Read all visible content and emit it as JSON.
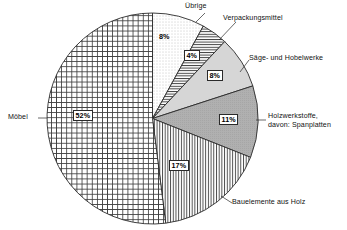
{
  "chart_data": {
    "type": "pie",
    "title": "",
    "subtitle": "",
    "xlabel": "",
    "ylabel": "",
    "legend_position": "callout-labels",
    "grid": false,
    "unit": "%",
    "total": 100,
    "categories": [
      "Übrige",
      "Verpackungsmittel",
      "Säge- und Hobelwerke",
      "Holzwerkstoffe, davon: Spanplatten",
      "Bauelemente aus Holz",
      "Möbel"
    ],
    "values": [
      8,
      4,
      8,
      11,
      17,
      52
    ],
    "slices": [
      {
        "name": "uebrige",
        "label": "Übrige",
        "value": 8,
        "value_text": "8%",
        "fill": "dotted",
        "start_angle": 0,
        "end_angle": 28.8
      },
      {
        "name": "verpackungsmittel",
        "label": "Verpackungsmittel",
        "value": 4,
        "value_text": "4%",
        "fill": "horizontal-lines",
        "start_angle": 28.8,
        "end_angle": 43.2
      },
      {
        "name": "saege-und-hobelwerke",
        "label": "Säge- und Hobelwerke",
        "value": 8,
        "value_text": "8%",
        "fill": "light-gray",
        "start_angle": 43.2,
        "end_angle": 72.0
      },
      {
        "name": "holzwerkstoffe",
        "label": "Holzwerkstoffe, davon: Spanplatten",
        "label_line1": "Holzwerkstoffe,",
        "label_line2": "davon: Spanplatten",
        "value": 11,
        "value_text": "11%",
        "fill": "dark-gray",
        "start_angle": 72.0,
        "end_angle": 111.6
      },
      {
        "name": "bauelemente-aus-holz",
        "label": "Bauelemente aus Holz",
        "value": 17,
        "value_text": "17%",
        "fill": "vertical-lines",
        "start_angle": 111.6,
        "end_angle": 172.8
      },
      {
        "name": "moebel",
        "label": "Möbel",
        "value": 52,
        "value_text": "52%",
        "fill": "crosshatch",
        "start_angle": 172.8,
        "end_angle": 360.0
      }
    ]
  },
  "colors": {
    "outline": "#2a2a2a",
    "light_gray": "#d4d4d4",
    "dark_gray": "#a8a8a8",
    "text": "#111111",
    "background": "#ffffff"
  }
}
